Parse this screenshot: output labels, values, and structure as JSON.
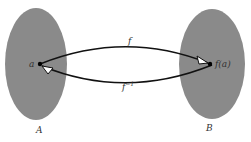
{
  "diagram": {
    "set_a": {
      "label": "A",
      "color": "#8a8a8a"
    },
    "set_b": {
      "label": "B",
      "color": "#8a8a8a"
    },
    "point_a": {
      "label": "a"
    },
    "point_fa": {
      "label": "f(a)"
    },
    "arrow_forward": {
      "label": "f"
    },
    "arrow_inverse": {
      "label": "f",
      "superscript": "−1"
    }
  }
}
